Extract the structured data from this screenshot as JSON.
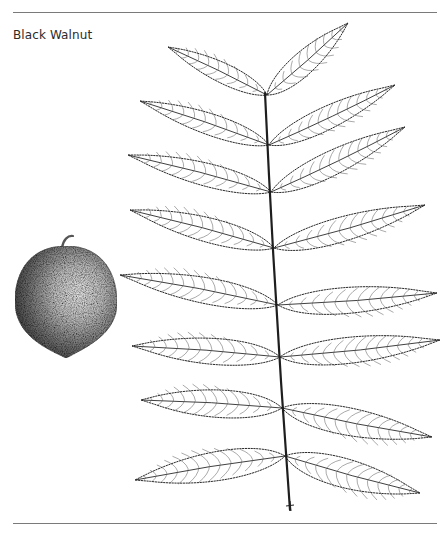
{
  "caption": {
    "title": "Black Walnut"
  },
  "illustration": {
    "subject": "Black Walnut",
    "parts": [
      "nut",
      "pinnately-compound-leaf"
    ],
    "ink_color": "#2a2a2a",
    "nut_shade_dark": "#3a3a3a",
    "nut_shade_light": "#d8d8d8",
    "rule_color": "#7a7a7a"
  },
  "leaf": {
    "rachis": {
      "x1": 265,
      "y1": 93,
      "x2": 290,
      "y2": 510
    },
    "terminal": {
      "base": [
        267,
        95
      ],
      "tip": [
        348,
        23
      ],
      "width": 30
    },
    "leaflets": [
      {
        "side": "left",
        "base": [
          267,
          95
        ],
        "tip": [
          168,
          47
        ],
        "width": 26
      },
      {
        "side": "left",
        "base": [
          269,
          145
        ],
        "tip": [
          140,
          101
        ],
        "width": 28
      },
      {
        "side": "right",
        "base": [
          269,
          145
        ],
        "tip": [
          395,
          85
        ],
        "width": 30
      },
      {
        "side": "left",
        "base": [
          271,
          192
        ],
        "tip": [
          128,
          155
        ],
        "width": 30
      },
      {
        "side": "right",
        "base": [
          271,
          192
        ],
        "tip": [
          405,
          127
        ],
        "width": 32
      },
      {
        "side": "left",
        "base": [
          274,
          248
        ],
        "tip": [
          130,
          210
        ],
        "width": 32
      },
      {
        "side": "right",
        "base": [
          274,
          248
        ],
        "tip": [
          425,
          205
        ],
        "width": 32
      },
      {
        "side": "left",
        "base": [
          278,
          305
        ],
        "tip": [
          120,
          275
        ],
        "width": 34
      },
      {
        "side": "right",
        "base": [
          278,
          305
        ],
        "tip": [
          437,
          293
        ],
        "width": 34
      },
      {
        "side": "left",
        "base": [
          280,
          357
        ],
        "tip": [
          132,
          346
        ],
        "width": 34
      },
      {
        "side": "right",
        "base": [
          280,
          357
        ],
        "tip": [
          440,
          340
        ],
        "width": 34
      },
      {
        "side": "left",
        "base": [
          282,
          408
        ],
        "tip": [
          141,
          400
        ],
        "width": 36
      },
      {
        "side": "right",
        "base": [
          282,
          408
        ],
        "tip": [
          432,
          437
        ],
        "width": 36
      },
      {
        "side": "left",
        "base": [
          285,
          456
        ],
        "tip": [
          135,
          480
        ],
        "width": 38
      },
      {
        "side": "right",
        "base": [
          285,
          456
        ],
        "tip": [
          420,
          493
        ],
        "width": 38
      }
    ]
  },
  "nut": {
    "cx": 66,
    "cy": 300,
    "rx": 51,
    "ry": 54,
    "stem": [
      [
        62,
        248
      ],
      [
        63,
        240
      ],
      [
        68,
        235
      ],
      [
        73,
        236
      ]
    ]
  }
}
